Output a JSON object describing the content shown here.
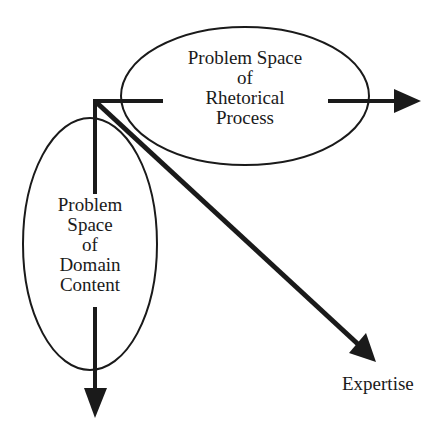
{
  "diagram": {
    "colors": {
      "ink": "#1a1a1a",
      "background": "#ffffff"
    },
    "nodes": {
      "rhetorical": {
        "lines": [
          "Problem Space",
          "of",
          "Rhetorical",
          "Process"
        ]
      },
      "domain": {
        "lines": [
          "Problem",
          "Space",
          "of",
          "Domain",
          "Content"
        ]
      }
    },
    "axes": {
      "horizontal": {
        "label": ""
      },
      "vertical": {
        "label": ""
      },
      "diagonal": {
        "label": "Expertise"
      }
    }
  }
}
